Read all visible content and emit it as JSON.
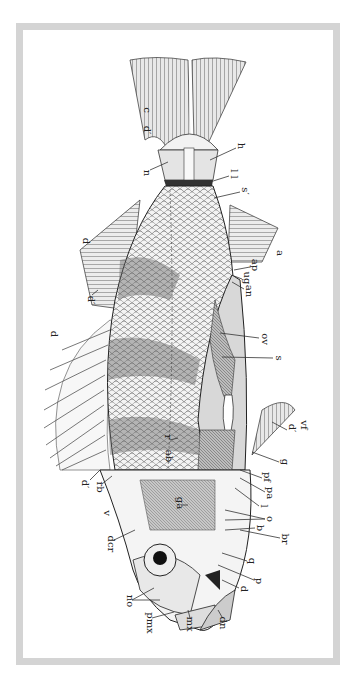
{
  "figure": {
    "orientation": "rotated-90-clockwise",
    "colors": {
      "frame": "#d4d4d4",
      "ink": "#222222",
      "background": "#ffffff",
      "body_shade": "#6a6a6a",
      "fin": "#8a8a8a"
    }
  },
  "labels": [
    {
      "id": "c",
      "text": "c",
      "x": 146,
      "y": 110
    },
    {
      "id": "d-prime-caudal",
      "text": "d′",
      "x": 146,
      "y": 130
    },
    {
      "id": "n",
      "text": "n",
      "x": 146,
      "y": 173
    },
    {
      "id": "h",
      "text": "h",
      "x": 240,
      "y": 146
    },
    {
      "id": "ll",
      "text": "l l",
      "x": 233,
      "y": 174
    },
    {
      "id": "s-scale",
      "text": "s′",
      "x": 244,
      "y": 191
    },
    {
      "id": "d-second-dorsal",
      "text": "d",
      "x": 85,
      "y": 241
    },
    {
      "id": "d-prime-second-dorsal",
      "text": "d′",
      "x": 90,
      "y": 300
    },
    {
      "id": "d-first-dorsal",
      "text": "d",
      "x": 53,
      "y": 334
    },
    {
      "id": "a",
      "text": "a",
      "x": 279,
      "y": 253
    },
    {
      "id": "ap",
      "text": "ap",
      "x": 254,
      "y": 265
    },
    {
      "id": "ug",
      "text": "ug",
      "x": 246,
      "y": 278
    },
    {
      "id": "an",
      "text": "an",
      "x": 248,
      "y": 291
    },
    {
      "id": "ov",
      "text": "ov",
      "x": 264,
      "y": 339
    },
    {
      "id": "s-stomach",
      "text": "s",
      "x": 278,
      "y": 358
    },
    {
      "id": "d-prime-ventral",
      "text": "d′",
      "x": 291,
      "y": 428
    },
    {
      "id": "vf",
      "text": "vf",
      "x": 303,
      "y": 425
    },
    {
      "id": "r",
      "text": "r",
      "x": 167,
      "y": 437
    },
    {
      "id": "ab",
      "text": "ab",
      "x": 168,
      "y": 456
    },
    {
      "id": "g",
      "text": "g",
      "x": 284,
      "y": 462
    },
    {
      "id": "d-prime-spine",
      "text": "d′",
      "x": 84,
      "y": 484
    },
    {
      "id": "rb",
      "text": "rb",
      "x": 99,
      "y": 487
    },
    {
      "id": "pf",
      "text": "pf",
      "x": 266,
      "y": 477
    },
    {
      "id": "pa",
      "text": "pa",
      "x": 269,
      "y": 493
    },
    {
      "id": "l",
      "text": "l",
      "x": 263,
      "y": 506
    },
    {
      "id": "ga",
      "text": "ga",
      "x": 179,
      "y": 503
    },
    {
      "id": "v",
      "text": "v",
      "x": 106,
      "y": 513
    },
    {
      "id": "o",
      "text": "o",
      "x": 269,
      "y": 519
    },
    {
      "id": "b",
      "text": "b",
      "x": 259,
      "y": 528
    },
    {
      "id": "br",
      "text": "br",
      "x": 284,
      "y": 539
    },
    {
      "id": "dcr",
      "text": "dcr",
      "x": 110,
      "y": 544
    },
    {
      "id": "q",
      "text": "q",
      "x": 251,
      "y": 561
    },
    {
      "id": "p",
      "text": "p",
      "x": 258,
      "y": 581
    },
    {
      "id": "d-jaw",
      "text": "d",
      "x": 243,
      "y": 589
    },
    {
      "id": "no",
      "text": "no",
      "x": 129,
      "y": 601
    },
    {
      "id": "pmx",
      "text": "pmx",
      "x": 149,
      "y": 623
    },
    {
      "id": "mx",
      "text": "mx",
      "x": 189,
      "y": 624
    },
    {
      "id": "dn",
      "text": "dn",
      "x": 222,
      "y": 623
    }
  ]
}
